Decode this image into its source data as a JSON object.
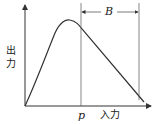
{
  "diagram": {
    "type": "input-output curve",
    "y_axis_label": "出力",
    "x_axis_label": "入力",
    "marker_p": "p",
    "dimension_label": "B",
    "colors": {
      "line": "#333333",
      "background": "#ffffff"
    }
  }
}
